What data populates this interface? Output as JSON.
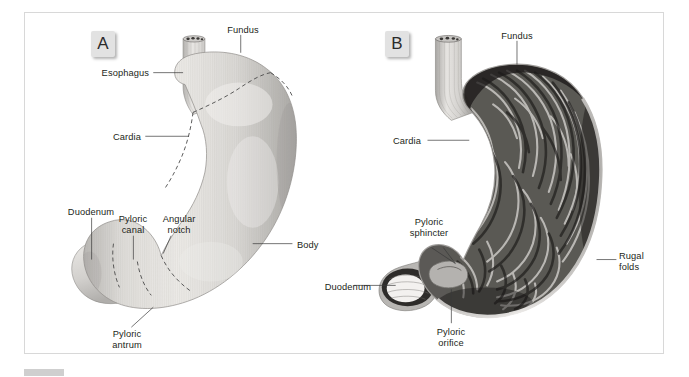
{
  "figure": {
    "panels": [
      {
        "id": "A",
        "badge_label": "A",
        "view": "external surface of the stomach",
        "labels": [
          {
            "name": "fundus",
            "text": "Fundus"
          },
          {
            "name": "esophagus",
            "text": "Esophagus"
          },
          {
            "name": "cardia",
            "text": "Cardia"
          },
          {
            "name": "duodenum",
            "text": "Duodenum"
          },
          {
            "name": "pyloric-canal",
            "text": "Pyloric\ncanal"
          },
          {
            "name": "angular-notch",
            "text": "Angular\nnotch"
          },
          {
            "name": "body",
            "text": "Body"
          },
          {
            "name": "pyloric-antrum",
            "text": "Pyloric\nantrum"
          }
        ]
      },
      {
        "id": "B",
        "badge_label": "B",
        "view": "interior of the stomach showing rugal folds",
        "labels": [
          {
            "name": "fundus",
            "text": "Fundus"
          },
          {
            "name": "cardia",
            "text": "Cardia"
          },
          {
            "name": "pyloric-sphincter",
            "text": "Pyloric\nsphincter"
          },
          {
            "name": "duodenum",
            "text": "Duodenum"
          },
          {
            "name": "pyloric-orifice",
            "text": "Pyloric\norifice"
          },
          {
            "name": "rugal-folds",
            "text": "Rugal\nfolds"
          }
        ]
      }
    ],
    "caption": {
      "label": "",
      "text": ""
    }
  },
  "colors": {
    "frame_border": "#d8d8d8",
    "badge_bg": "#e2e2e2",
    "label_text": "#231f20",
    "leader_line": "#3a3a3a",
    "organ_light": "#d5d3d0",
    "organ_dark": "#4a4846",
    "background": "#ffffff"
  }
}
